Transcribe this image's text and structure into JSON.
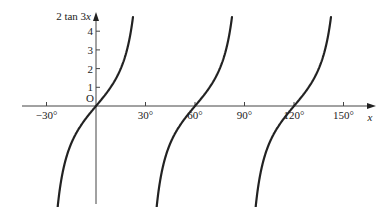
{
  "chart_data": {
    "type": "line",
    "title": "",
    "function": "y = 2 tan 3x",
    "ylabel": "2 tan 3x",
    "xlabel": "x",
    "origin_label": "O",
    "x_ticks": [
      "−30°",
      "30°",
      "60°",
      "90°",
      "120°",
      "150°"
    ],
    "x_tick_values": [
      -30,
      30,
      60,
      90,
      120,
      150
    ],
    "y_ticks": [
      "1",
      "2",
      "3",
      "4"
    ],
    "y_tick_values": [
      1,
      2,
      3,
      4
    ],
    "xlim": [
      -40,
      160
    ],
    "ylim": [
      -5,
      4.8
    ],
    "grid": false,
    "legend": null,
    "series": [
      {
        "name": "branch 1",
        "x_range": [
          -22.5,
          22.5
        ],
        "center": 0,
        "x": [
          -22.5,
          -15,
          -10,
          -5,
          0,
          5,
          10,
          15,
          22.5
        ],
        "values": [
          -4.8,
          -2,
          -1.15,
          -0.54,
          0,
          0.54,
          1.15,
          2,
          4.8
        ]
      },
      {
        "name": "branch 2",
        "x_range": [
          37.5,
          82.5
        ],
        "center": 60,
        "x": [
          37.5,
          45,
          50,
          55,
          60,
          65,
          70,
          75,
          82.5
        ],
        "values": [
          -4.8,
          -2,
          -1.15,
          -0.54,
          0,
          0.54,
          1.15,
          2,
          4.8
        ]
      },
      {
        "name": "branch 3",
        "x_range": [
          97.5,
          142.5
        ],
        "center": 120,
        "x": [
          97.5,
          105,
          110,
          115,
          120,
          125,
          130,
          135,
          142.5
        ],
        "values": [
          -4.8,
          -2,
          -1.15,
          -0.54,
          0,
          0.54,
          1.15,
          2,
          4.8
        ]
      }
    ]
  }
}
